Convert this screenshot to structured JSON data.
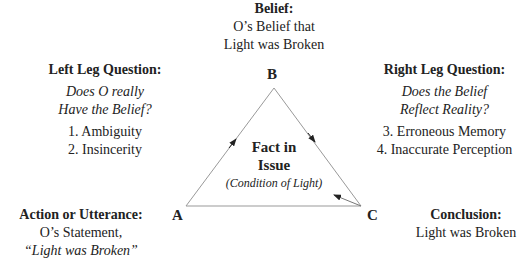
{
  "diagram": {
    "type": "hearsay-testimonial-triangle",
    "vertices": {
      "A": "A",
      "B": "B",
      "C": "C"
    },
    "belief": {
      "heading": "Belief:",
      "line1": "O’s Belief that",
      "line2": "Light was Broken"
    },
    "left_leg": {
      "heading": "Left Leg Question:",
      "question1": "Does O really",
      "question2": "Have the Belief?",
      "item1": "1. Ambiguity",
      "item2": "2. Insincerity"
    },
    "right_leg": {
      "heading": "Right Leg Question:",
      "question1": "Does the Belief",
      "question2": "Reflect Reality?",
      "item1": "3. Erroneous Memory",
      "item2": "4. Inaccurate Perception"
    },
    "center": {
      "line1": "Fact in",
      "line2": "Issue",
      "sub": "(Condition of Light)"
    },
    "action": {
      "heading": "Action or Utterance:",
      "line1": "O’s Statement,",
      "line2": "“Light was Broken”"
    },
    "conclusion": {
      "heading": "Conclusion:",
      "line1": "Light was Broken"
    },
    "colors": {
      "line": "#999999",
      "text": "#222222"
    }
  }
}
